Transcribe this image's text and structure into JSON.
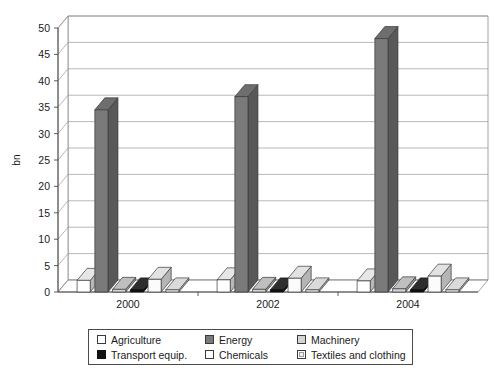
{
  "chart_data": {
    "type": "bar",
    "title": "",
    "subtitle": "",
    "xlabel": "",
    "ylabel": "bn",
    "categories": [
      "2000",
      "2002",
      "2004"
    ],
    "ylim": [
      0,
      50
    ],
    "yticks": [
      0,
      5,
      10,
      15,
      20,
      25,
      30,
      35,
      40,
      45,
      50
    ],
    "grid": true,
    "legend_position": "bottom",
    "style": "3d-grouped-column",
    "series": [
      {
        "name": "Agriculture",
        "values": [
          2.2,
          2.3,
          2.1
        ],
        "color": "#ffffff",
        "border": "#3a3a3a"
      },
      {
        "name": "Energy",
        "values": [
          34.5,
          37.0,
          48.0
        ],
        "color": "#7a7a7a",
        "border": "#3a3a3a"
      },
      {
        "name": "Machinery",
        "values": [
          0.5,
          0.5,
          0.6
        ],
        "color": "#d4d4d4",
        "border": "#3a3a3a"
      },
      {
        "name": "Transport equip.",
        "values": [
          0.4,
          0.4,
          0.4
        ],
        "color": "#111111",
        "border": "#111111"
      },
      {
        "name": "Chemicals",
        "values": [
          2.4,
          2.6,
          3.0
        ],
        "color": "#fbfbfb",
        "border": "#3a3a3a"
      },
      {
        "name": "Textiles and clothing",
        "values": [
          0.4,
          0.4,
          0.4
        ],
        "color": "#f2f2f2",
        "border": "#3a3a3a"
      }
    ]
  },
  "axes": {
    "y_title": "bn"
  },
  "legend": {
    "items": [
      {
        "label": "Agriculture"
      },
      {
        "label": "Energy"
      },
      {
        "label": "Machinery"
      },
      {
        "label": "Transport equip."
      },
      {
        "label": "Chemicals"
      },
      {
        "label": "Textiles and clothing"
      }
    ]
  }
}
